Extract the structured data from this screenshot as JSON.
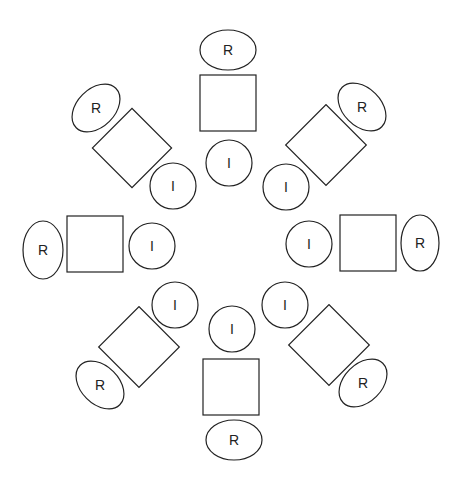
{
  "diagram": {
    "type": "radial-seating-layout",
    "stroke_color": "#222222",
    "background": "#ffffff",
    "center": [
      230,
      246
    ],
    "labels": {
      "outer": "R",
      "inner": "I"
    },
    "groups": [
      {
        "name": "top",
        "outer_label": "R",
        "inner_label": "I",
        "outer": {
          "cx": 228,
          "cy": 50,
          "rx": 28,
          "ry": 20,
          "rot": 0
        },
        "block": {
          "cx": 228,
          "cy": 103,
          "size": 56,
          "rot": 0
        },
        "inner": {
          "cx": 229,
          "cy": 163,
          "r": 23
        }
      },
      {
        "name": "top-right",
        "outer_label": "R",
        "inner_label": "I",
        "outer": {
          "cx": 362,
          "cy": 107,
          "rx": 28,
          "ry": 19,
          "rot": 45
        },
        "block": {
          "cx": 326,
          "cy": 145,
          "size": 57,
          "rot": 45
        },
        "inner": {
          "cx": 286,
          "cy": 187,
          "r": 23
        }
      },
      {
        "name": "right",
        "outer_label": "R",
        "inner_label": "I",
        "outer": {
          "cx": 420,
          "cy": 243,
          "rx": 19,
          "ry": 28,
          "rot": 0
        },
        "block": {
          "cx": 368,
          "cy": 243,
          "size": 56,
          "rot": 0
        },
        "inner": {
          "cx": 309,
          "cy": 244,
          "r": 23
        }
      },
      {
        "name": "bottom-right",
        "outer_label": "R",
        "inner_label": "I",
        "outer": {
          "cx": 363,
          "cy": 383,
          "rx": 28,
          "ry": 19,
          "rot": -45
        },
        "block": {
          "cx": 329,
          "cy": 345,
          "size": 57,
          "rot": 45
        },
        "inner": {
          "cx": 285,
          "cy": 305,
          "r": 23
        }
      },
      {
        "name": "bottom",
        "outer_label": "R",
        "inner_label": "I",
        "outer": {
          "cx": 234,
          "cy": 440,
          "rx": 28,
          "ry": 20,
          "rot": 0
        },
        "block": {
          "cx": 231,
          "cy": 387,
          "size": 56,
          "rot": 0
        },
        "inner": {
          "cx": 232,
          "cy": 329,
          "r": 23
        }
      },
      {
        "name": "bottom-left",
        "outer_label": "R",
        "inner_label": "I",
        "outer": {
          "cx": 100,
          "cy": 385,
          "rx": 28,
          "ry": 19,
          "rot": 45
        },
        "block": {
          "cx": 139,
          "cy": 347,
          "size": 57,
          "rot": 45
        },
        "inner": {
          "cx": 175,
          "cy": 305,
          "r": 23
        }
      },
      {
        "name": "left",
        "outer_label": "R",
        "inner_label": "I",
        "outer": {
          "cx": 43,
          "cy": 250,
          "rx": 20,
          "ry": 29,
          "rot": 0
        },
        "block": {
          "cx": 95,
          "cy": 244,
          "size": 56,
          "rot": 0
        },
        "inner": {
          "cx": 152,
          "cy": 246,
          "r": 23
        }
      },
      {
        "name": "top-left",
        "outer_label": "R",
        "inner_label": "I",
        "outer": {
          "cx": 96,
          "cy": 108,
          "rx": 28,
          "ry": 19,
          "rot": -45
        },
        "block": {
          "cx": 132,
          "cy": 148,
          "size": 56,
          "rot": 45
        },
        "inner": {
          "cx": 173,
          "cy": 186,
          "r": 23
        }
      }
    ]
  }
}
